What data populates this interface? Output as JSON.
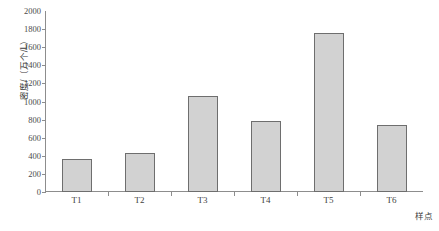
{
  "chart_data": {
    "type": "bar",
    "title": "",
    "categories": [
      "T1",
      "T2",
      "T3",
      "T4",
      "T5",
      "T6"
    ],
    "values": [
      365,
      430,
      1060,
      780,
      1760,
      740
    ],
    "series": [
      {
        "name": "密度",
        "values": [
          365,
          430,
          1060,
          780,
          1760,
          740
        ]
      }
    ],
    "xlabel": "样点",
    "ylabel": "密度/（万个/L）",
    "ylim": [
      0,
      2000
    ],
    "ytick_values": [
      0,
      200,
      400,
      600,
      800,
      1000,
      1200,
      1400,
      1600,
      1800,
      2000
    ],
    "ytick_labels": [
      "0",
      "200",
      "400",
      "600",
      "800",
      "1000",
      "1200",
      "1400",
      "1600",
      "1800",
      "2000"
    ],
    "grid": false,
    "legend": false,
    "bar_fill_color": "#d2d2d2",
    "bar_edge_color": "#6e6e6e",
    "axis_color": "#8d8d8d"
  }
}
